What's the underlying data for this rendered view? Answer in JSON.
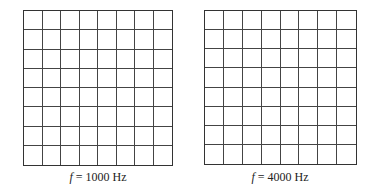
{
  "panels": [
    {
      "id": "left",
      "rows": 8,
      "cols": 8,
      "box": {
        "x": 23,
        "y": 10,
        "w": 150,
        "h": 156
      },
      "caption": {
        "var": "f",
        "text": " = 1000 Hz",
        "x": 98,
        "y": 178
      }
    },
    {
      "id": "right",
      "rows": 8,
      "cols": 8,
      "box": {
        "x": 204,
        "y": 10,
        "w": 153,
        "h": 155
      },
      "caption": {
        "var": "f",
        "text": " = 4000 Hz",
        "x": 280,
        "y": 178
      }
    }
  ],
  "colors": {
    "line": "#444444",
    "background": "#ffffff",
    "text": "#222222"
  }
}
